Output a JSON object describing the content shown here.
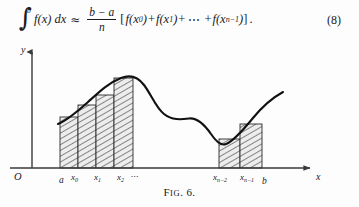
{
  "equation": {
    "integral_upper": "b",
    "integral_lower": "a",
    "integrand": "f(x) dx",
    "approx_symbol": "≈",
    "fraction_numerator": "b − a",
    "fraction_denominator": "n",
    "bracket_open": "[",
    "term_1": "f(x",
    "term_1_sub": "0",
    "term_1_close": ")",
    "plus_1": "+",
    "term_2": "f(x",
    "term_2_sub": "1",
    "term_2_close": ")",
    "plus_2": "+",
    "dots": "⋯",
    "plus_3": "+",
    "term_last": "f(x",
    "term_last_sub": "n−1",
    "term_last_close": ")",
    "bracket_close": "]",
    "period": ".",
    "tag": "(8)"
  },
  "figure": {
    "y_axis_label": "y",
    "x_axis_label": "x",
    "origin_label": "O",
    "tick_labels": [
      {
        "id": "a",
        "text": "a",
        "sub": "",
        "x": 59,
        "y": 183,
        "size": 9.5
      },
      {
        "id": "x0",
        "text": "x",
        "sub": "0",
        "x": 71,
        "y": 180,
        "size": 9
      },
      {
        "id": "x1",
        "text": "x",
        "sub": "1",
        "x": 94,
        "y": 180,
        "size": 9
      },
      {
        "id": "x2",
        "text": "x",
        "sub": "2",
        "x": 117,
        "y": 180,
        "size": 9
      },
      {
        "id": "ellipsis",
        "text": "⋯",
        "sub": "",
        "x": 130,
        "y": 179,
        "size": 8
      },
      {
        "id": "xn2",
        "text": "x",
        "sub": "n−2",
        "x": 213,
        "y": 180,
        "size": 9
      },
      {
        "id": "xn1",
        "text": "x",
        "sub": "n−1",
        "x": 240,
        "y": 180,
        "size": 9
      },
      {
        "id": "b",
        "text": "b",
        "sub": "",
        "x": 262,
        "y": 184,
        "size": 9.5
      }
    ]
  },
  "caption": {
    "first_letter": "F",
    "rest": "IG",
    "number": ". 6."
  },
  "chart_data": {
    "type": "area",
    "xlabel": "x",
    "ylabel": "y",
    "axis_origin_label": "O",
    "grid": false,
    "legend": null,
    "baseline_y": 168,
    "y_axis_x": 32,
    "x_axis_y": 168,
    "x_axis_arrow_end": 316,
    "y_axis_arrow_top": 48,
    "partition_points": [
      "a",
      "x0",
      "x1",
      "x2",
      "...",
      "xn-2",
      "xn-1",
      "b"
    ],
    "bars": [
      {
        "label": "a",
        "x": 60,
        "width": 18,
        "top": 117
      },
      {
        "label": "x0",
        "x": 78,
        "width": 18,
        "top": 105
      },
      {
        "label": "x1",
        "x": 96,
        "width": 18,
        "top": 95
      },
      {
        "label": "x2",
        "x": 114,
        "width": 19,
        "top": 78
      },
      {
        "label": "xn-2",
        "x": 219,
        "width": 21,
        "top": 139
      },
      {
        "label": "xn-1",
        "x": 240,
        "width": 22,
        "top": 124
      }
    ],
    "bar_fill": "#e9e9e9",
    "bar_hatch_color": "#2d2d2d",
    "curve_color": "#111111",
    "axis_color": "#3a3a3a",
    "curve_path": "M 60,122 C 70,118 80,110 90,101 C 100,92 110,83 122,78 C 131,74 139,76 145,84 C 152,93 157,108 164,114 C 172,121 181,120 189,119 C 197,118 204,123 211,134 C 216,142 221,146 226,144 C 234,141 244,129 253,118 C 262,107 272,98 282,92",
    "curve_description": "Smooth function: rises from left, peaks near x2, dips to a local minimum right of center, rises again toward b and beyond"
  }
}
